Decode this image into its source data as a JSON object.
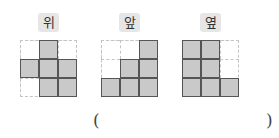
{
  "views": [
    {
      "label": "위",
      "name": "top",
      "left": 20,
      "cells": [
        [
          0,
          1,
          0
        ],
        [
          1,
          1,
          1
        ],
        [
          0,
          1,
          1
        ]
      ]
    },
    {
      "label": "앞",
      "name": "front",
      "left": 101,
      "cells": [
        [
          0,
          0,
          1
        ],
        [
          0,
          1,
          1
        ],
        [
          1,
          1,
          1
        ]
      ]
    },
    {
      "label": "옆",
      "name": "side",
      "left": 182,
      "cells": [
        [
          1,
          1,
          0
        ],
        [
          1,
          1,
          0
        ],
        [
          1,
          1,
          1
        ]
      ]
    }
  ],
  "answer": {
    "open_paren": "(",
    "close_paren": ")",
    "value": ""
  },
  "colors": {
    "filled": "#c9c9c9",
    "border": "#555555",
    "dashed": "#c4c4c4",
    "badge": "#e6e6e6"
  }
}
